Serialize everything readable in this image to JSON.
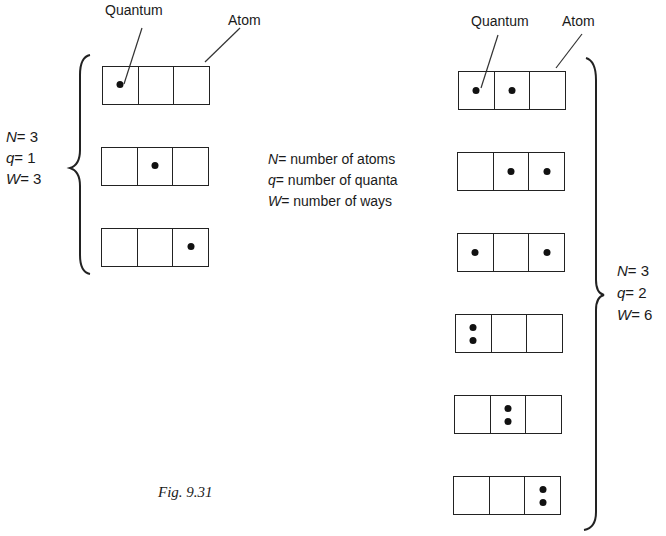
{
  "labels": {
    "quantum_left": "Quantum",
    "atom_left": "Atom",
    "quantum_right": "Quantum",
    "atom_right": "Atom"
  },
  "legend": [
    {
      "symbol": "N",
      "text": "= number of atoms"
    },
    {
      "symbol": "q",
      "text": "= number of quanta"
    },
    {
      "symbol": "W",
      "text": "= number of ways"
    }
  ],
  "left_group": {
    "params": [
      {
        "symbol": "N",
        "text": "= 3"
      },
      {
        "symbol": "q",
        "text": "= 1"
      },
      {
        "symbol": "W",
        "text": "= 3"
      }
    ],
    "arrangements": [
      [
        1,
        0,
        0
      ],
      [
        0,
        1,
        0
      ],
      [
        0,
        0,
        1
      ]
    ]
  },
  "right_group": {
    "params": [
      {
        "symbol": "N",
        "text": "= 3"
      },
      {
        "symbol": "q",
        "text": "= 2"
      },
      {
        "symbol": "W",
        "text": "= 6"
      }
    ],
    "arrangements": [
      [
        1,
        1,
        0
      ],
      [
        0,
        1,
        1
      ],
      [
        1,
        0,
        1
      ],
      [
        2,
        0,
        0
      ],
      [
        0,
        2,
        0
      ],
      [
        0,
        0,
        2
      ]
    ]
  },
  "caption": "Fig. 9.31"
}
